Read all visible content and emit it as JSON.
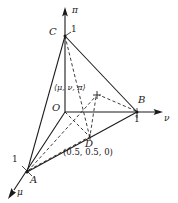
{
  "figure": {
    "background_color": "#ffffff",
    "line_color": "#1a1a1a",
    "axes": [
      {
        "name": "pi",
        "label": "π",
        "direction": "up",
        "label_pos": [
          72,
          7
        ]
      },
      {
        "name": "nu",
        "label": "ν",
        "direction": "right",
        "label_pos": [
          164,
          116
        ]
      },
      {
        "name": "mu",
        "label": "μ",
        "direction": "down-left",
        "label_pos": [
          16,
          190
        ]
      }
    ],
    "vertices": [
      {
        "name": "C",
        "label": "C",
        "tick": "1",
        "coords_px": [
          65,
          36
        ],
        "label_pos": [
          51,
          29
        ],
        "tick_pos": [
          71,
          28
        ]
      },
      {
        "name": "B",
        "label": "B",
        "tick": "1",
        "coords_px": [
          137,
          112
        ],
        "label_pos": [
          138,
          98
        ],
        "tick_pos": [
          135,
          116
        ]
      },
      {
        "name": "A",
        "label": "A",
        "tick": "1",
        "coords_px": [
          27,
          172
        ],
        "label_pos": [
          30,
          176
        ],
        "tick_pos": [
          13,
          158
        ]
      },
      {
        "name": "O",
        "label": "O",
        "tick": "",
        "coords_px": [
          65,
          112
        ],
        "label_pos": [
          53,
          105
        ],
        "tick_pos": [
          0,
          0
        ]
      },
      {
        "name": "D",
        "label": "D",
        "tick": "",
        "coords_px": [
          90,
          138
        ],
        "label_pos": [
          85,
          141
        ],
        "tick_pos": [
          0,
          0
        ]
      }
    ],
    "point_labels": {
      "interior": "⟨μ, ν, π⟩",
      "interior_pos": [
        56,
        86
      ],
      "interior_coords_px": [
        97,
        95
      ],
      "d_coords": "(0.5, 0.5, 0)",
      "d_coords_pos": [
        64,
        148
      ]
    },
    "markers": {
      "interior_marker": "plus-marker",
      "d_marker": "tick-marker"
    },
    "edges_solid": [
      {
        "name": "edge-C-A",
        "from": [
          65,
          36
        ],
        "to": [
          27,
          172
        ]
      },
      {
        "name": "edge-C-B",
        "from": [
          65,
          36
        ],
        "to": [
          137,
          112
        ]
      },
      {
        "name": "edge-A-B",
        "from": [
          27,
          172
        ],
        "to": [
          137,
          112
        ]
      },
      {
        "name": "axis-O-B",
        "from": [
          65,
          112
        ],
        "to": [
          137,
          112
        ]
      },
      {
        "name": "axis-O-C",
        "from": [
          65,
          112
        ],
        "to": [
          65,
          36
        ]
      },
      {
        "name": "axis-O-A",
        "from": [
          65,
          112
        ],
        "to": [
          27,
          172
        ]
      }
    ],
    "edges_dashed": [
      {
        "name": "dashed-C-D",
        "from": [
          65,
          36
        ],
        "to": [
          90,
          138
        ]
      },
      {
        "name": "dashed-A-point",
        "from": [
          27,
          172
        ],
        "to": [
          97,
          95
        ]
      },
      {
        "name": "dashed-B-point",
        "from": [
          137,
          112
        ],
        "to": [
          97,
          95
        ]
      },
      {
        "name": "dashed-point-D",
        "from": [
          97,
          95
        ],
        "to": [
          90,
          138
        ]
      },
      {
        "name": "dashed-O-D",
        "from": [
          65,
          112
        ],
        "to": [
          90,
          138
        ]
      },
      {
        "name": "dashed-A-D-lower",
        "from": [
          27,
          172
        ],
        "to": [
          90,
          138
        ]
      }
    ]
  }
}
